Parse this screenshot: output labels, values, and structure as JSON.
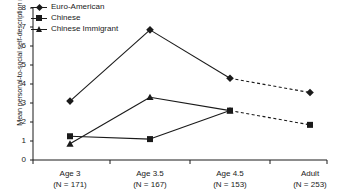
{
  "chart_data": {
    "type": "line",
    "title": "",
    "xlabel": "",
    "ylabel": "Mean personal-to-social self-description ratio",
    "categories": [
      "Age 3",
      "Age 3.5",
      "Age 4.5",
      "Adult"
    ],
    "category_sublabels": [
      "(N = 171)",
      "(N = 167)",
      "(N = 153)",
      "(N = 253)"
    ],
    "ylim": [
      0,
      8
    ],
    "yticks": [
      8,
      7,
      6,
      5,
      4,
      3,
      2,
      1,
      0
    ],
    "grid": false,
    "legend_position": "top-left",
    "series": [
      {
        "name": "Euro-American",
        "marker": "diamond",
        "values": [
          3.1,
          6.85,
          4.3,
          3.55
        ],
        "dashed_segments": [
          [
            2,
            3
          ]
        ]
      },
      {
        "name": "Chinese",
        "marker": "square",
        "values": [
          1.25,
          1.1,
          2.6,
          1.85
        ],
        "dashed_segments": [
          [
            2,
            3
          ]
        ]
      },
      {
        "name": "Chinese Immigrant",
        "marker": "triangle",
        "values": [
          0.85,
          3.3,
          2.6,
          null
        ],
        "dashed_segments": []
      }
    ],
    "line_color": "#1a1a1a"
  },
  "legend": {
    "items": [
      {
        "label": "Euro-American"
      },
      {
        "label": "Chinese"
      },
      {
        "label": "Chinese Immigrant"
      }
    ]
  },
  "axis": {
    "y_title": "Mean personal-to-social self-description ratio",
    "y_labels": [
      "8",
      "7",
      "6",
      "5",
      "4",
      "3",
      "2",
      "1",
      "0"
    ],
    "x_groups": [
      {
        "name": "Age 3",
        "n": "(N = 171)"
      },
      {
        "name": "Age 3.5",
        "n": "(N = 167)"
      },
      {
        "name": "Age 4.5",
        "n": "(N = 153)"
      },
      {
        "name": "Adult",
        "n": "(N = 253)"
      }
    ]
  }
}
